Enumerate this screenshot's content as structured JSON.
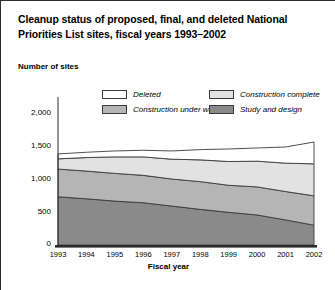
{
  "title": {
    "line1": "Cleanup status of proposed, final, and deleted National",
    "line2": "Priorities List sites, fiscal years 1993–2002"
  },
  "axis_title_y": "Number of sites",
  "axis_title_x": "Fiscal year",
  "colors": {
    "deleted": "#ffffff",
    "construction_complete": "#e2e2e2",
    "construction_under_way": "#b5b5b5",
    "study_and_design": "#8a8a8a",
    "outline": "#3a3a3a",
    "axis": "#2b2b2b"
  },
  "legend": {
    "items": [
      {
        "label": "Deleted",
        "key": "deleted"
      },
      {
        "label": "Construction complete",
        "key": "construction_complete"
      },
      {
        "label": "Construction under way",
        "key": "construction_under_way"
      },
      {
        "label": "Study and design",
        "key": "study_and_design"
      }
    ]
  },
  "chart_data": {
    "type": "area",
    "stacked": true,
    "title": "Cleanup status of proposed, final, and deleted National Priorities List sites, fiscal years 1993–2002",
    "xlabel": "Fiscal year",
    "ylabel": "Number of sites",
    "x": [
      "1993",
      "1994",
      "1995",
      "1996",
      "1997",
      "1998",
      "1999",
      "2000",
      "2001",
      "2002"
    ],
    "categories": [
      "1993",
      "1994",
      "1995",
      "1996",
      "1997",
      "1998",
      "1999",
      "2000",
      "2001",
      "2002"
    ],
    "ylim": [
      0,
      2000
    ],
    "yticks": [
      0,
      500,
      1000,
      1500,
      2000
    ],
    "ytick_labels": [
      "0",
      "500",
      "1,000",
      "1,500",
      "2,000"
    ],
    "grid": false,
    "legend_position": "top",
    "stack_order_bottom_to_top": [
      "study_and_design",
      "construction_under_way",
      "construction_complete",
      "deleted"
    ],
    "series": [
      {
        "name": "Study and design",
        "key": "study_and_design",
        "values": [
          730,
          700,
          665,
          640,
          590,
          540,
          495,
          455,
          380,
          300
        ]
      },
      {
        "name": "Construction under way",
        "key": "construction_under_way",
        "values": [
          420,
          420,
          420,
          415,
          410,
          420,
          410,
          425,
          430,
          445
        ]
      },
      {
        "name": "Construction complete",
        "key": "construction_complete",
        "values": [
          155,
          205,
          250,
          280,
          300,
          330,
          360,
          390,
          430,
          485
        ]
      },
      {
        "name": "Deleted",
        "key": "deleted",
        "values": [
          75,
          80,
          90,
          100,
          125,
          155,
          190,
          200,
          245,
          330
        ]
      }
    ],
    "totals": [
      1380,
      1405,
      1425,
      1435,
      1425,
      1445,
      1455,
      1470,
      1485,
      1560
    ]
  }
}
